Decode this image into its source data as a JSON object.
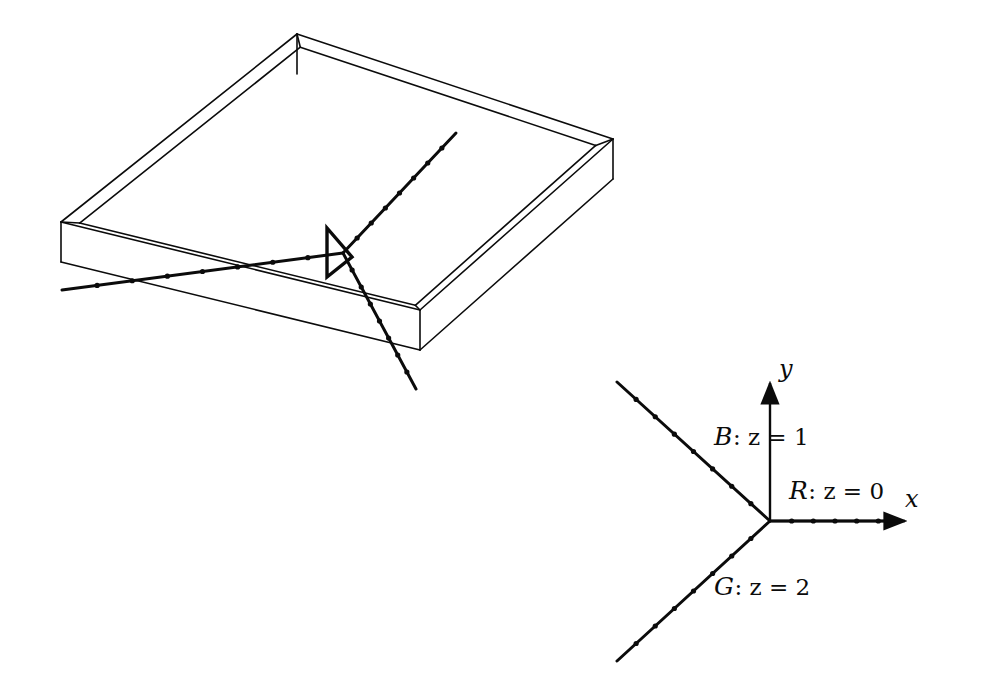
{
  "figure": {
    "background_color": "#ffffff",
    "ink_color": "#0b0b0b",
    "width": 989,
    "height": 699
  },
  "left_panel": {
    "name": "3d-slab-panel",
    "description": "Wireframe rectangular slab viewed in oblique projection containing three rays meeting at a junction marked by a triangular wedge.",
    "slab": {
      "top_face_corners": [
        [
          297,
          34
        ],
        [
          613,
          139
        ],
        [
          420,
          310
        ],
        [
          61,
          222
        ]
      ],
      "thickness_offset": [
        0,
        40
      ],
      "edge_color": "#0b0b0b",
      "edge_width": 1.6
    },
    "rays": [
      {
        "name": "ray-left",
        "label_ref": "R",
        "from": [
          343,
          253
        ],
        "to": [
          62,
          290
        ],
        "dot_count": 7
      },
      {
        "name": "ray-upper-right",
        "label_ref": "B",
        "from": [
          343,
          253
        ],
        "to": [
          456,
          133
        ],
        "dot_count": 7
      },
      {
        "name": "ray-lower-right",
        "label_ref": "G",
        "from": [
          343,
          253
        ],
        "to": [
          416,
          389
        ],
        "dot_count": 7
      }
    ],
    "junction_marker": {
      "name": "wedge-marker",
      "shape": "triangle",
      "apex": [
        352,
        257
      ],
      "base_top": [
        327,
        228
      ],
      "base_bottom": [
        327,
        277
      ]
    }
  },
  "right_panel": {
    "name": "2d-axes-panel",
    "origin": [
      770,
      521
    ],
    "axes": [
      {
        "name": "x-axis",
        "label": "x",
        "label_pos": [
          905,
          487
        ],
        "from": [
          770,
          521
        ],
        "to": [
          905,
          521
        ],
        "arrow": true
      },
      {
        "name": "y-axis",
        "label": "y",
        "label_pos": [
          779,
          357
        ],
        "from": [
          770,
          521
        ],
        "to": [
          770,
          383
        ],
        "arrow": true
      }
    ],
    "rays": [
      {
        "id": "R",
        "name": "ray-R",
        "label": "ℛ : z = 0",
        "cal_letter": "R",
        "body": ": z = 0",
        "z_value": 0,
        "angle_deg": 0,
        "from": [
          770,
          521
        ],
        "to": [
          900,
          521
        ],
        "dot_count": 5,
        "label_pos": [
          789,
          478
        ]
      },
      {
        "id": "B",
        "name": "ray-B",
        "label": "ℬ : z = 1",
        "cal_letter": "B",
        "body": ": z = 1",
        "z_value": 1,
        "angle_deg": 135,
        "from": [
          770,
          521
        ],
        "to": [
          617,
          382
        ],
        "dot_count": 7,
        "label_pos": [
          714,
          424
        ]
      },
      {
        "id": "G",
        "name": "ray-G",
        "label": "𝒢 : z = 2",
        "cal_letter": "G",
        "body": ": z = 2",
        "z_value": 2,
        "angle_deg": 225,
        "from": [
          770,
          521
        ],
        "to": [
          617,
          661
        ],
        "dot_count": 7,
        "label_pos": [
          714,
          574
        ]
      }
    ]
  },
  "style": {
    "ray_width": 3.0,
    "dot_radius": 2.6,
    "axis_width": 2.4
  }
}
